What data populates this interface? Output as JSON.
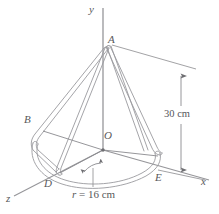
{
  "figure": {
    "kind": "engineering-diagram",
    "background_color": "#ffffff",
    "stroke_color": "#8e8e92",
    "text_color": "#58585a",
    "axes": [
      {
        "id": "y",
        "label": "y",
        "x": 94,
        "y": 9
      },
      {
        "id": "x",
        "label": "x",
        "x": 203,
        "y": 182
      },
      {
        "id": "z",
        "label": "z",
        "x": 8,
        "y": 198
      }
    ],
    "points": [
      {
        "id": "A",
        "label": "A",
        "x": 110,
        "y": 40
      },
      {
        "id": "B",
        "label": "B",
        "x": 26,
        "y": 120
      },
      {
        "id": "O",
        "label": "O",
        "x": 105,
        "y": 136
      },
      {
        "id": "D",
        "label": "D",
        "x": 46,
        "y": 182
      },
      {
        "id": "E",
        "label": "E",
        "x": 157,
        "y": 177
      }
    ],
    "dimensions": [
      {
        "id": "height",
        "value": "30",
        "unit": "cm",
        "text": "30 cm",
        "x": 166,
        "y": 114,
        "orientation": "vertical"
      },
      {
        "id": "radius",
        "symbol": "r",
        "rest": " = 16 cm",
        "text": "r = 16 cm",
        "x": 74,
        "y": 194,
        "orientation": "leader"
      }
    ]
  }
}
